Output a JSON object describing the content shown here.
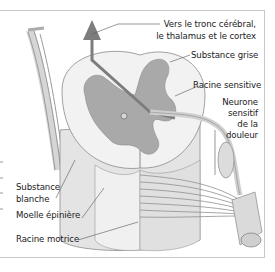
{
  "diagram": {
    "labels": {
      "tract_line1": "Vers le tronc cérébral,",
      "tract_line2": "le thalamus et le cortex",
      "grey_matter": "Substance grise",
      "sensory_root": "Racine sensitive",
      "pain_neuron_line1": "Neurone",
      "pain_neuron_line2": "sensitif",
      "pain_neuron_line3": "de la",
      "pain_neuron_line4": "douleur",
      "white_matter_line1": "Substance",
      "white_matter_line2": "blanche",
      "spinal_cord": "Moelle épinière",
      "motor_root": "Racine motrice"
    },
    "colors": {
      "grey_matter": "#a9a9a9",
      "white_matter": "#ececec",
      "outline": "#8a8a8a",
      "leader_line": "#555555",
      "frame": "#c8c8c8",
      "arrow": "#7d7d7d"
    }
  }
}
